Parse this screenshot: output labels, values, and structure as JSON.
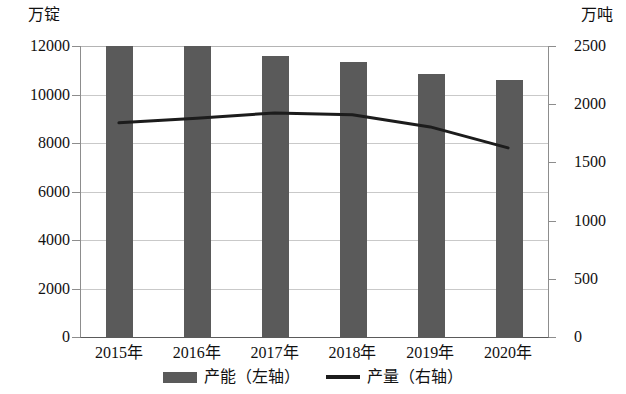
{
  "chart_data": {
    "type": "bar",
    "title": "",
    "subtitle": "",
    "xlabel": "",
    "categories": [
      "2015年",
      "2016年",
      "2017年",
      "2018年",
      "2019年",
      "2020年"
    ],
    "grid": true,
    "legend_position": "bottom",
    "left_axis": {
      "unit_label": "万锭",
      "ylabel": "万锭",
      "ylim": [
        0,
        12000
      ],
      "tick_step": 2000,
      "ticks": [
        "0",
        "2000",
        "4000",
        "6000",
        "8000",
        "10000",
        "12000"
      ],
      "tick_values": [
        0,
        2000,
        4000,
        6000,
        8000,
        10000,
        12000
      ]
    },
    "right_axis": {
      "unit_label": "万吨",
      "ylabel": "万吨",
      "ylim": [
        0,
        2500
      ],
      "tick_step": 500,
      "ticks": [
        "0",
        "500",
        "1000",
        "1500",
        "2000",
        "2500"
      ],
      "tick_values": [
        0,
        500,
        1000,
        1500,
        2000,
        2500
      ]
    },
    "series": [
      {
        "name": "产能（左轴）",
        "type": "bar",
        "axis": "left",
        "color": "#5a5a5a",
        "values": [
          12000,
          12000,
          11580,
          11330,
          10830,
          10580
        ]
      },
      {
        "name": "产量（右轴）",
        "type": "line",
        "axis": "right",
        "color": "#1c1c1c",
        "values": [
          1840,
          1880,
          1925,
          1910,
          1805,
          1625
        ]
      }
    ]
  },
  "legend": {
    "items": [
      {
        "label": "产能（左轴）",
        "swatch": "bar-swatch",
        "color": "#5a5a5a"
      },
      {
        "label": "产量（右轴）",
        "swatch": "line-swatch",
        "color": "#1c1c1c"
      }
    ]
  }
}
